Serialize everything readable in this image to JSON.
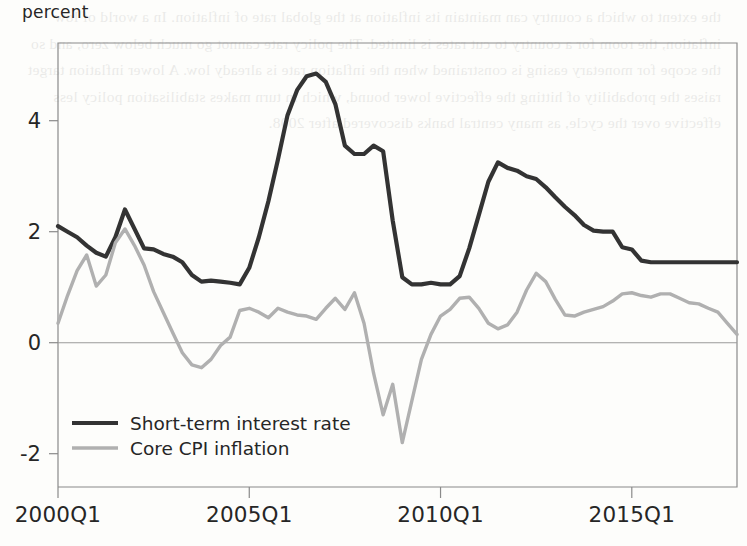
{
  "figure": {
    "y_axis_label": "percent",
    "background": "#fdfdfb",
    "frame_color": "#8a8a8a"
  },
  "bleed_text": "the extent to which a country can maintain its inflation at the global rate of inflation. In a world of low inflation, the room for a country to cut rates is limited. The policy rate cannot go much below zero, and so the scope for monetary easing is constrained when the inflation rate is already low. A lower inflation target raises the probability of hitting the effective lower bound, which in turn makes stabilisation policy less effective over the cycle, as many central banks discovered after 2008.",
  "legend": {
    "position": "inside-bottom-left",
    "entries": [
      {
        "label": "Short-term interest rate",
        "color": "#333333",
        "width": 4.2
      },
      {
        "label": "Core CPI inflation",
        "color": "#b0b0b0",
        "width": 3.4
      }
    ]
  },
  "chart_data": {
    "type": "line",
    "title": "",
    "subtitle": "",
    "xlabel": "",
    "ylabel": "percent",
    "grid": false,
    "zero_line": true,
    "xlim": [
      "2000Q1",
      "2017Q4"
    ],
    "ylim": [
      -2.6,
      5.4
    ],
    "yticks": [
      4,
      2,
      0,
      -2
    ],
    "ytick_labels": [
      "4",
      "2",
      "0",
      "-2"
    ],
    "xticks": [
      "2000Q1",
      "2005Q1",
      "2010Q1",
      "2015Q1"
    ],
    "x": [
      "2000Q1",
      "2000Q2",
      "2000Q3",
      "2000Q4",
      "2001Q1",
      "2001Q2",
      "2001Q3",
      "2001Q4",
      "2002Q1",
      "2002Q2",
      "2002Q3",
      "2002Q4",
      "2003Q1",
      "2003Q2",
      "2003Q3",
      "2003Q4",
      "2004Q1",
      "2004Q2",
      "2004Q3",
      "2004Q4",
      "2005Q1",
      "2005Q2",
      "2005Q3",
      "2005Q4",
      "2006Q1",
      "2006Q2",
      "2006Q3",
      "2006Q4",
      "2007Q1",
      "2007Q2",
      "2007Q3",
      "2007Q4",
      "2008Q1",
      "2008Q2",
      "2008Q3",
      "2008Q4",
      "2009Q1",
      "2009Q2",
      "2009Q3",
      "2009Q4",
      "2010Q1",
      "2010Q2",
      "2010Q3",
      "2010Q4",
      "2011Q1",
      "2011Q2",
      "2011Q3",
      "2011Q4",
      "2012Q1",
      "2012Q2",
      "2012Q3",
      "2012Q4",
      "2013Q1",
      "2013Q2",
      "2013Q3",
      "2013Q4",
      "2014Q1",
      "2014Q2",
      "2014Q3",
      "2014Q4",
      "2015Q1",
      "2015Q2",
      "2015Q3",
      "2015Q4",
      "2016Q1",
      "2016Q2",
      "2016Q3",
      "2016Q4",
      "2017Q1",
      "2017Q2",
      "2017Q3",
      "2017Q4"
    ],
    "series": [
      {
        "name": "Short-term interest rate",
        "color": "#333333",
        "values": [
          2.1,
          2.0,
          1.9,
          1.75,
          1.62,
          1.55,
          1.9,
          2.4,
          2.05,
          1.7,
          1.68,
          1.6,
          1.55,
          1.45,
          1.22,
          1.1,
          1.12,
          1.1,
          1.08,
          1.05,
          1.35,
          1.9,
          2.55,
          3.3,
          4.1,
          4.55,
          4.8,
          4.85,
          4.7,
          4.3,
          3.55,
          3.4,
          3.4,
          3.55,
          3.45,
          2.2,
          1.18,
          1.05,
          1.05,
          1.08,
          1.05,
          1.05,
          1.2,
          1.7,
          2.3,
          2.9,
          3.25,
          3.15,
          3.1,
          3.0,
          2.95,
          2.8,
          2.62,
          2.45,
          2.3,
          2.12,
          2.02,
          2.0,
          2.0,
          1.72,
          1.68,
          1.48,
          1.45,
          1.45,
          1.45,
          1.45,
          1.45,
          1.45,
          1.45,
          1.45,
          1.45,
          1.45
        ]
      },
      {
        "name": "Core CPI inflation",
        "color": "#b0b0b0",
        "values": [
          0.35,
          0.85,
          1.3,
          1.58,
          1.02,
          1.22,
          1.8,
          2.05,
          1.75,
          1.4,
          0.92,
          0.55,
          0.18,
          -0.18,
          -0.4,
          -0.45,
          -0.3,
          -0.05,
          0.1,
          0.58,
          0.62,
          0.55,
          0.45,
          0.62,
          0.55,
          0.5,
          0.48,
          0.42,
          0.62,
          0.8,
          0.6,
          0.9,
          0.35,
          -0.55,
          -1.3,
          -0.75,
          -1.8,
          -1.05,
          -0.3,
          0.15,
          0.48,
          0.6,
          0.8,
          0.82,
          0.62,
          0.35,
          0.25,
          0.32,
          0.55,
          0.95,
          1.25,
          1.1,
          0.78,
          0.5,
          0.48,
          0.55,
          0.6,
          0.65,
          0.75,
          0.88,
          0.9,
          0.85,
          0.82,
          0.88,
          0.88,
          0.8,
          0.72,
          0.7,
          0.62,
          0.55,
          0.35,
          0.15
        ]
      }
    ]
  }
}
